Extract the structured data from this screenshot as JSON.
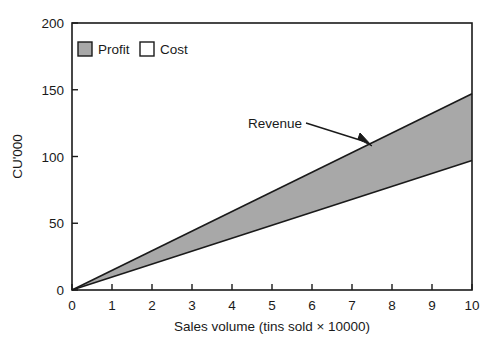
{
  "chart_data": {
    "type": "area",
    "title": "",
    "subtitle": "",
    "xlabel": "Sales volume (tins sold × 10000)",
    "ylabel": "CU'000",
    "xlim": [
      0,
      10
    ],
    "ylim": [
      0,
      200
    ],
    "xticks": [
      "0",
      "1",
      "2",
      "3",
      "4",
      "5",
      "6",
      "7",
      "8",
      "9",
      "10"
    ],
    "yticks": [
      "0",
      "50",
      "100",
      "150",
      "200"
    ],
    "grid": false,
    "legend_position": "top-left-inside",
    "x": [
      0,
      10
    ],
    "series": [
      {
        "name": "Revenue",
        "values": [
          0,
          147
        ],
        "role": "upper-boundary",
        "line_color": "#1a1a1a"
      },
      {
        "name": "Cost",
        "values": [
          0,
          97
        ],
        "role": "lower-boundary",
        "line_color": "#1a1a1a"
      }
    ],
    "fill_between": {
      "name": "Profit",
      "upper_series": "Revenue",
      "lower_series": "Cost",
      "fill_color": "#a8a8a8"
    },
    "annotations": [
      {
        "text": "Revenue",
        "points_to_x": 7.2,
        "points_to_y": 106,
        "label_x": 4.4,
        "label_y": 122
      }
    ]
  },
  "legend": {
    "items": [
      {
        "label": "Profit",
        "swatch_fill": "#a8a8a8",
        "swatch_stroke": "#1a1a1a"
      },
      {
        "label": "Cost",
        "swatch_fill": "#ffffff",
        "swatch_stroke": "#1a1a1a"
      }
    ]
  },
  "axes": {
    "x_title": "Sales volume (tins sold × 10000)",
    "y_title": "CU'000",
    "x_tick_labels": [
      "0",
      "1",
      "2",
      "3",
      "4",
      "5",
      "6",
      "7",
      "8",
      "9",
      "10"
    ],
    "y_tick_labels": [
      "0",
      "50",
      "100",
      "150",
      "200"
    ],
    "frame_color": "#1a1a1a"
  },
  "annotation": {
    "revenue_label": "Revenue"
  },
  "colors": {
    "profit_fill": "#a8a8a8",
    "line": "#1a1a1a",
    "background": "#ffffff"
  }
}
